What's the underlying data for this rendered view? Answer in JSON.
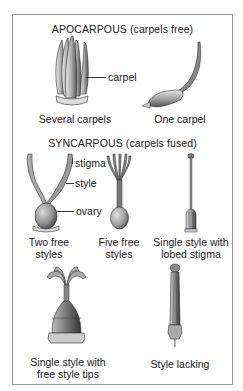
{
  "sections": {
    "apocarpous": {
      "heading": "APOCARPOUS (carpels free)",
      "items": [
        {
          "label": "Several carpels",
          "callouts": [
            "carpel"
          ]
        },
        {
          "label": "One carpel"
        }
      ]
    },
    "syncarpous": {
      "heading": "SYNCARPOUS (carpels fused)",
      "items": [
        {
          "label_line1": "Two free",
          "label_line2": "styles",
          "callouts": [
            "stigma",
            "style",
            "ovary"
          ]
        },
        {
          "label_line1": "Five free",
          "label_line2": "styles"
        },
        {
          "label_line1": "Single style with",
          "label_line2": "lobed stigma"
        },
        {
          "label_line1": "Single style with",
          "label_line2": "free style tips"
        },
        {
          "label_line1": "Style lacking"
        }
      ]
    }
  },
  "colors": {
    "frame": "#9a9a9a",
    "ink": "#222222",
    "shade_dark": "#555555",
    "shade_mid": "#9a9a9a",
    "shade_light": "#d8d8d8"
  }
}
